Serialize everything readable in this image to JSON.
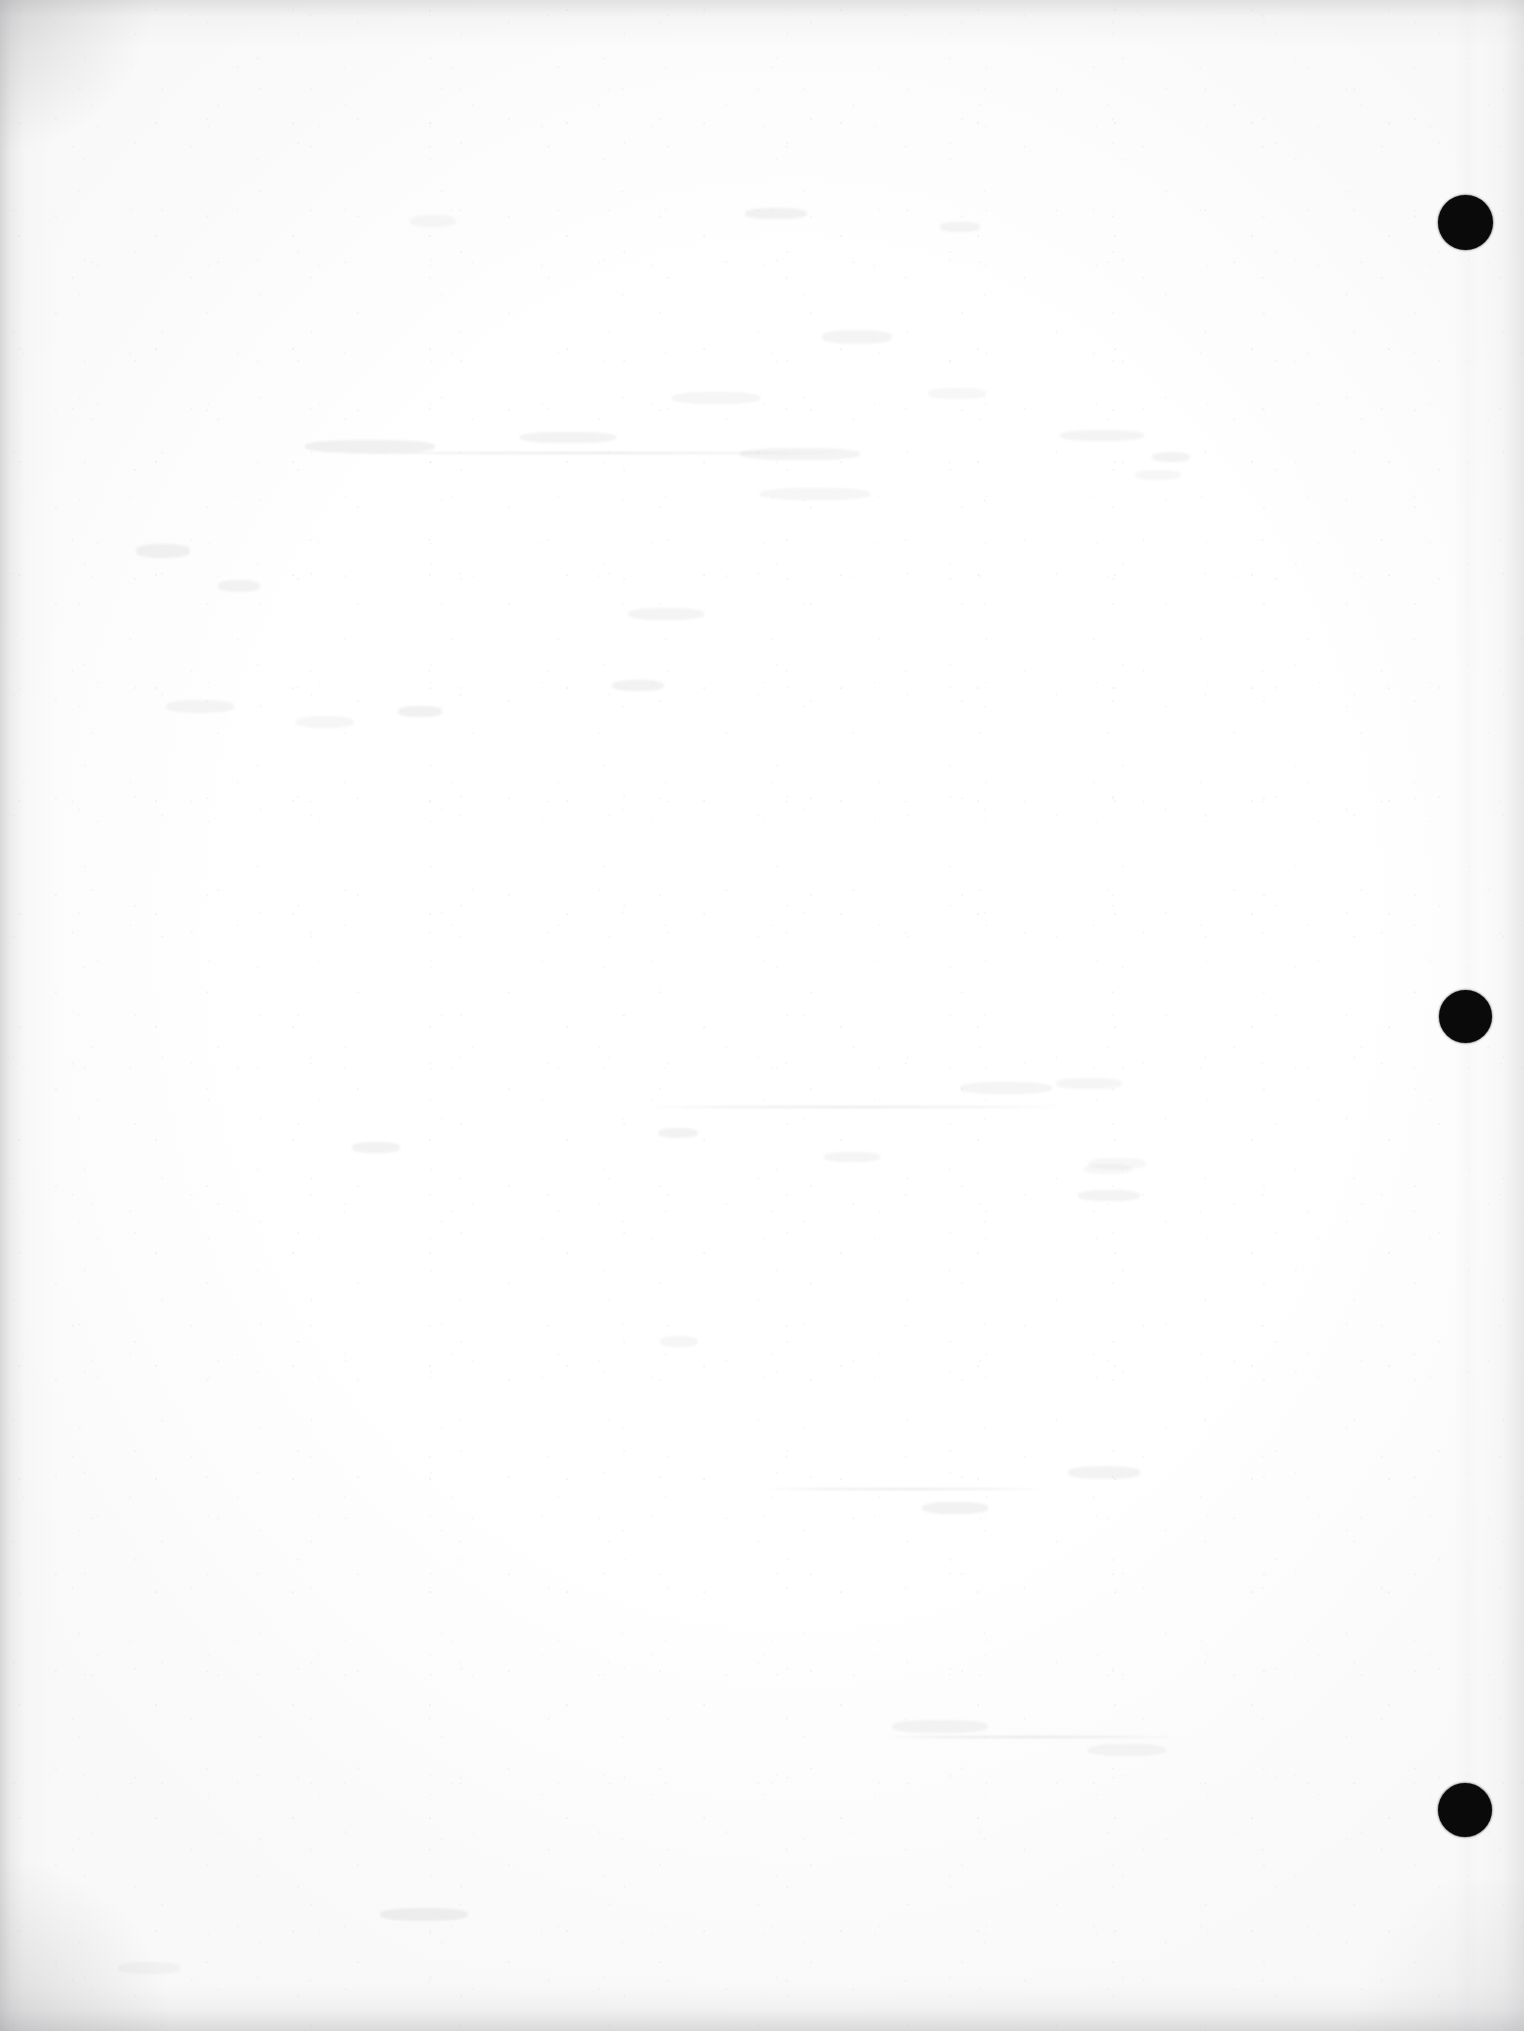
{
  "document": {
    "kind": "scanned-page",
    "title": "Blank scanned page",
    "page_text": "",
    "page_width": 1524,
    "page_height": 2031,
    "paper_color": "#fdfdfd",
    "ink_color": "#0a0a0a",
    "edge_shadow_color": "#a8a8aa",
    "orientation": "portrait",
    "content_summary": "Blank page verso with three punched binding marks in right margin"
  },
  "binding_marks": {
    "label": "hole punch marks",
    "color": "#0a0a0a",
    "count": 3,
    "holes": [
      {
        "id": "hole-top",
        "cx": 1465,
        "cy": 222,
        "d": 55
      },
      {
        "id": "hole-middle",
        "cx": 1465,
        "cy": 1016,
        "d": 53
      },
      {
        "id": "hole-bottom",
        "cx": 1465,
        "cy": 1810,
        "d": 54
      }
    ]
  },
  "artifacts": {
    "label": "scan artifacts",
    "ghost_marks": [
      {
        "x": 410,
        "y": 215,
        "w": 46,
        "h": 12
      },
      {
        "x": 745,
        "y": 208,
        "w": 62,
        "h": 11
      },
      {
        "x": 940,
        "y": 222,
        "w": 40,
        "h": 10
      },
      {
        "x": 822,
        "y": 330,
        "w": 70,
        "h": 14
      },
      {
        "x": 672,
        "y": 392,
        "w": 88,
        "h": 12
      },
      {
        "x": 928,
        "y": 388,
        "w": 58,
        "h": 11
      },
      {
        "x": 305,
        "y": 440,
        "w": 130,
        "h": 13
      },
      {
        "x": 520,
        "y": 432,
        "w": 96,
        "h": 11
      },
      {
        "x": 740,
        "y": 448,
        "w": 120,
        "h": 12
      },
      {
        "x": 1060,
        "y": 430,
        "w": 84,
        "h": 11
      },
      {
        "x": 760,
        "y": 488,
        "w": 110,
        "h": 12
      },
      {
        "x": 1135,
        "y": 470,
        "w": 46,
        "h": 10
      },
      {
        "x": 136,
        "y": 544,
        "w": 54,
        "h": 14
      },
      {
        "x": 218,
        "y": 580,
        "w": 42,
        "h": 12
      },
      {
        "x": 628,
        "y": 608,
        "w": 76,
        "h": 12
      },
      {
        "x": 166,
        "y": 700,
        "w": 68,
        "h": 13
      },
      {
        "x": 296,
        "y": 716,
        "w": 58,
        "h": 12
      },
      {
        "x": 398,
        "y": 706,
        "w": 44,
        "h": 11
      },
      {
        "x": 612,
        "y": 680,
        "w": 52,
        "h": 11
      },
      {
        "x": 1152,
        "y": 452,
        "w": 38,
        "h": 10
      },
      {
        "x": 960,
        "y": 1082,
        "w": 92,
        "h": 12
      },
      {
        "x": 1056,
        "y": 1078,
        "w": 66,
        "h": 11
      },
      {
        "x": 1088,
        "y": 1158,
        "w": 58,
        "h": 11
      },
      {
        "x": 352,
        "y": 1142,
        "w": 48,
        "h": 11
      },
      {
        "x": 658,
        "y": 1128,
        "w": 40,
        "h": 10
      },
      {
        "x": 1078,
        "y": 1190,
        "w": 62,
        "h": 11
      },
      {
        "x": 824,
        "y": 1152,
        "w": 56,
        "h": 10
      },
      {
        "x": 660,
        "y": 1336,
        "w": 38,
        "h": 11
      },
      {
        "x": 1084,
        "y": 1164,
        "w": 48,
        "h": 10
      },
      {
        "x": 922,
        "y": 1502,
        "w": 66,
        "h": 12
      },
      {
        "x": 1068,
        "y": 1466,
        "w": 72,
        "h": 13
      },
      {
        "x": 892,
        "y": 1720,
        "w": 96,
        "h": 13
      },
      {
        "x": 1088,
        "y": 1744,
        "w": 78,
        "h": 12
      },
      {
        "x": 118,
        "y": 1962,
        "w": 62,
        "h": 12
      },
      {
        "x": 380,
        "y": 1908,
        "w": 88,
        "h": 13
      }
    ],
    "ghost_lines": [
      {
        "x": 760,
        "y": 1488,
        "w": 290
      },
      {
        "x": 880,
        "y": 1736,
        "w": 300
      },
      {
        "x": 330,
        "y": 452,
        "w": 520
      },
      {
        "x": 640,
        "y": 1106,
        "w": 430
      }
    ]
  }
}
